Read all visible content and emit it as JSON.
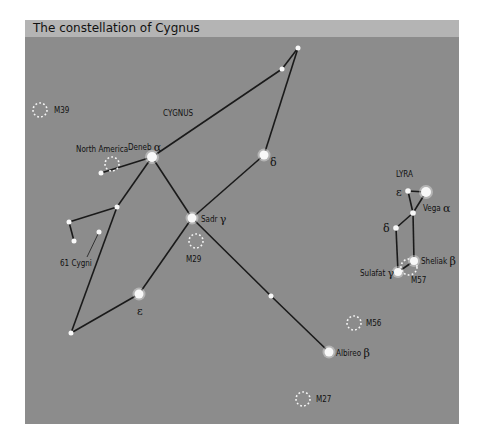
{
  "title": "The constellation of Cygnus",
  "colors": {
    "background": "#8c8c8c",
    "title_band": "#b4b4b4",
    "lines": "#1a1a1a",
    "stars": "#f8f8f8",
    "clusters": "#f4f4f4"
  },
  "constellations": [
    {
      "name": "CYGNUS",
      "label_pos": [
        163,
        116
      ]
    },
    {
      "name": "LYRA",
      "label_pos": [
        396,
        177
      ]
    }
  ],
  "stars": [
    {
      "id": "deneb",
      "name": "Deneb",
      "greek": "α",
      "x": 152,
      "y": 157,
      "r": 5
    },
    {
      "id": "sadr",
      "name": "Sadr",
      "greek": "γ",
      "x": 192,
      "y": 218,
      "r": 4.5
    },
    {
      "id": "cyg-delta",
      "name": "",
      "greek": "δ",
      "x": 264,
      "y": 155,
      "r": 4.5
    },
    {
      "id": "cyg-epsilon",
      "name": "",
      "greek": "ε",
      "x": 139,
      "y": 294,
      "r": 4.5
    },
    {
      "id": "albireo",
      "name": "Albireo",
      "greek": "β",
      "x": 329,
      "y": 352,
      "r": 4.5
    },
    {
      "id": "cyg-top",
      "name": "",
      "greek": "",
      "x": 298,
      "y": 48,
      "r": 2.5
    },
    {
      "id": "cyg-top2",
      "name": "",
      "greek": "",
      "x": 282,
      "y": 69,
      "r": 2.5
    },
    {
      "id": "cyg-na-end",
      "name": "",
      "greek": "",
      "x": 101,
      "y": 173,
      "r": 2.5
    },
    {
      "id": "cyg-wing-node",
      "name": "",
      "greek": "",
      "x": 117,
      "y": 207,
      "r": 2.5
    },
    {
      "id": "cyg-wing-a",
      "name": "",
      "greek": "",
      "x": 69,
      "y": 222,
      "r": 2.5
    },
    {
      "id": "cyg-wing-b",
      "name": "",
      "greek": "",
      "x": 74,
      "y": 241,
      "r": 2.5
    },
    {
      "id": "61-cygni",
      "name": "",
      "greek": "",
      "x": 99,
      "y": 232,
      "r": 2.5
    },
    {
      "id": "cyg-bottom-left",
      "name": "",
      "greek": "",
      "x": 71,
      "y": 333,
      "r": 2.5
    },
    {
      "id": "cyg-neck",
      "name": "",
      "greek": "",
      "x": 271,
      "y": 296,
      "r": 2.5
    },
    {
      "id": "vega",
      "name": "Vega",
      "greek": "α",
      "x": 426,
      "y": 192,
      "r": 5
    },
    {
      "id": "lyr-epsilon",
      "name": "",
      "greek": "ε",
      "x": 408,
      "y": 191,
      "r": 2.8
    },
    {
      "id": "lyr-node",
      "name": "",
      "greek": "",
      "x": 413,
      "y": 213,
      "r": 2.8
    },
    {
      "id": "lyr-delta",
      "name": "",
      "greek": "δ",
      "x": 396,
      "y": 228,
      "r": 2.8
    },
    {
      "id": "sheliak",
      "name": "Sheliak",
      "greek": "β",
      "x": 414,
      "y": 261,
      "r": 4
    },
    {
      "id": "sulafat",
      "name": "Sulafat",
      "greek": "γ",
      "x": 398,
      "y": 272,
      "r": 4
    }
  ],
  "lines": [
    [
      "cyg-top",
      "cyg-top2"
    ],
    [
      "cyg-top2",
      "deneb"
    ],
    [
      "cyg-top",
      "cyg-delta"
    ],
    [
      "cyg-delta",
      "sadr"
    ],
    [
      "deneb",
      "sadr"
    ],
    [
      "deneb",
      "cyg-na-end"
    ],
    [
      "deneb",
      "cyg-wing-node"
    ],
    [
      "cyg-wing-node",
      "cyg-wing-a"
    ],
    [
      "cyg-wing-a",
      "cyg-wing-b"
    ],
    [
      "cyg-wing-node",
      "cyg-bottom-left"
    ],
    [
      "cyg-bottom-left",
      "cyg-epsilon"
    ],
    [
      "cyg-epsilon",
      "sadr"
    ],
    [
      "sadr",
      "cyg-neck"
    ],
    [
      "cyg-neck",
      "albireo"
    ],
    [
      "lyr-epsilon",
      "vega"
    ],
    [
      "lyr-epsilon",
      "lyr-node"
    ],
    [
      "vega",
      "lyr-node"
    ],
    [
      "lyr-node",
      "lyr-delta"
    ],
    [
      "lyr-node",
      "sheliak"
    ],
    [
      "lyr-delta",
      "sulafat"
    ],
    [
      "sulafat",
      "sheliak"
    ]
  ],
  "pointer_61_cygni": {
    "from": [
      99,
      232
    ],
    "to": [
      87,
      257
    ]
  },
  "clusters": [
    {
      "id": "m39",
      "label": "M39",
      "x": 40,
      "y": 110,
      "r": 7,
      "label_pos": [
        54,
        113
      ]
    },
    {
      "id": "north-america",
      "label": "North America",
      "x": 112,
      "y": 164,
      "r": 7,
      "label_pos": [
        76,
        152
      ]
    },
    {
      "id": "m29",
      "label": "M29",
      "x": 196,
      "y": 241,
      "r": 7,
      "label_pos": [
        186,
        262
      ]
    },
    {
      "id": "m57",
      "label": "M57",
      "x": 409,
      "y": 267,
      "r": 8,
      "label_pos": [
        411,
        283
      ]
    },
    {
      "id": "m56",
      "label": "M56",
      "x": 354,
      "y": 323,
      "r": 7,
      "label_pos": [
        366,
        326
      ]
    },
    {
      "id": "m27",
      "label": "M27",
      "x": 303,
      "y": 399,
      "r": 7,
      "label_pos": [
        316,
        402
      ]
    }
  ],
  "labels": [
    {
      "for": "deneb",
      "text": "Deneb",
      "greek": "α",
      "x": 128,
      "y": 150
    },
    {
      "for": "sadr",
      "text": "Sadr",
      "greek": "γ",
      "x": 201,
      "y": 222
    },
    {
      "for": "cyg-delta",
      "text": "",
      "greek": "δ",
      "x": 270,
      "y": 166
    },
    {
      "for": "cyg-epsilon",
      "text": "",
      "greek": "ε",
      "x": 137,
      "y": 315
    },
    {
      "for": "albireo",
      "text": "Albireo",
      "greek": "β",
      "x": 336,
      "y": 356
    },
    {
      "for": "61-cygni",
      "text": "61 Cygni",
      "greek": "",
      "x": 60,
      "y": 266
    },
    {
      "for": "vega",
      "text": "Vega",
      "greek": "α",
      "x": 423,
      "y": 211
    },
    {
      "for": "lyr-epsilon",
      "text": "",
      "greek": "ε",
      "x": 396,
      "y": 196
    },
    {
      "for": "lyr-delta",
      "text": "",
      "greek": "δ",
      "x": 383,
      "y": 232
    },
    {
      "for": "sheliak",
      "text": "Sheliak",
      "greek": "β",
      "x": 421,
      "y": 264
    },
    {
      "for": "sulafat",
      "text": "Sulafat",
      "greek": "γ",
      "x": 360,
      "y": 276
    }
  ]
}
